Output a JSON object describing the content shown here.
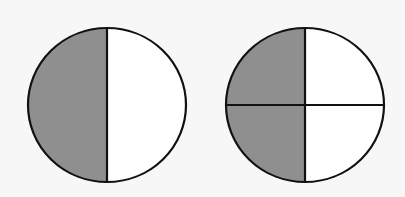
{
  "diagram": {
    "colors": {
      "shade": "#8f8f8f",
      "unshaded": "#ffffff",
      "stroke": "#111111",
      "background": "#f7f7f7"
    },
    "figures": [
      {
        "name": "halves-circle",
        "parts": 2,
        "shaded_parts": 1,
        "fraction": "1/2"
      },
      {
        "name": "quarters-circle",
        "parts": 4,
        "shaded_parts": 2,
        "fraction": "2/4"
      }
    ]
  }
}
